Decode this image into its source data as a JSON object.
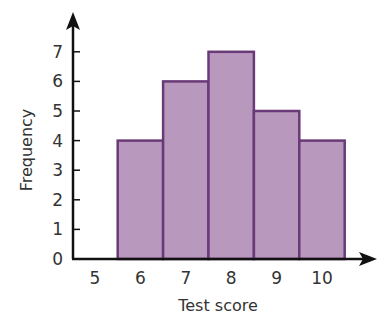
{
  "chart_data": {
    "type": "bar",
    "subtype": "histogram",
    "title": "",
    "xlabel": "Test score",
    "ylabel": "Frequency",
    "categories": [
      "6",
      "7",
      "8",
      "9",
      "10"
    ],
    "values": [
      4,
      6,
      7,
      5,
      4
    ],
    "x_ticks": [
      "5",
      "6",
      "7",
      "8",
      "9",
      "10"
    ],
    "y_ticks": [
      "0",
      "1",
      "2",
      "3",
      "4",
      "5",
      "6",
      "7"
    ],
    "ylim": [
      0,
      7
    ],
    "grid": false,
    "legend": null,
    "colors": {
      "fill": "#b898bc",
      "border": "#6a3a78",
      "axis": "#111111"
    }
  }
}
